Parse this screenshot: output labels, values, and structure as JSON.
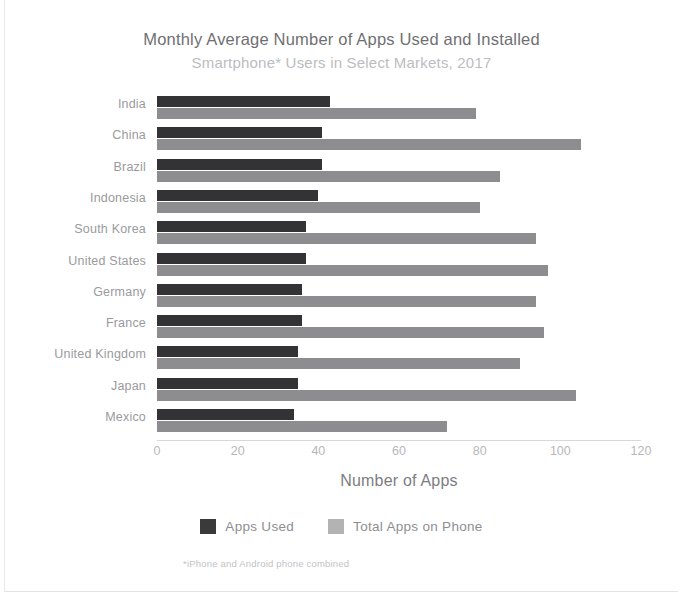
{
  "chart_data": {
    "type": "bar",
    "orientation": "horizontal",
    "title": "Monthly Average Number of Apps Used and Installed",
    "subtitle": "Smartphone* Users in Select Markets, 2017",
    "xlabel": "Number of Apps",
    "ylabel": "",
    "xlim": [
      0,
      120
    ],
    "xticks": [
      0,
      20,
      40,
      60,
      80,
      100,
      120
    ],
    "grid": false,
    "legend_position": "bottom",
    "footnote": "*iPhone and Android phone combined",
    "categories": [
      "India",
      "China",
      "Brazil",
      "Indonesia",
      "South Korea",
      "United States",
      "Germany",
      "France",
      "United Kingdom",
      "Japan",
      "Mexico"
    ],
    "series": [
      {
        "name": "Apps Used",
        "color": "#333336",
        "values": [
          43,
          41,
          41,
          40,
          37,
          37,
          36,
          36,
          35,
          35,
          34
        ]
      },
      {
        "name": "Total Apps on Phone",
        "color": "#8d8d90",
        "values": [
          79,
          105,
          85,
          80,
          94,
          97,
          94,
          96,
          90,
          104,
          72
        ]
      }
    ]
  }
}
